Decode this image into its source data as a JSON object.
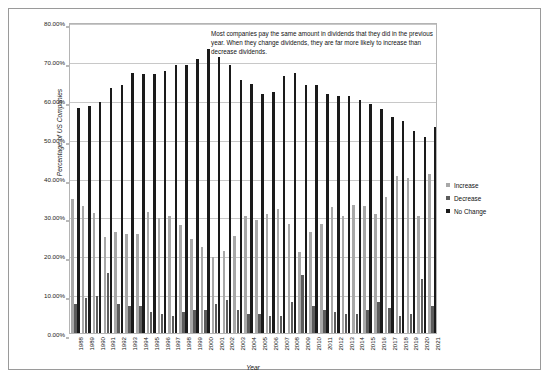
{
  "chart_data": {
    "type": "bar",
    "title": "",
    "xlabel": "Year",
    "ylabel": "Percentage of US Companies",
    "ylim": [
      0,
      80
    ],
    "ytick_labels": [
      "80.00%",
      "70.00%",
      "60.00%",
      "50.00%",
      "40.00%",
      "30.00%",
      "20.00%",
      "10.00%",
      "0.00%"
    ],
    "ytick_values": [
      80,
      70,
      60,
      50,
      40,
      30,
      20,
      10,
      0
    ],
    "grid": true,
    "legend_position": "right",
    "categories": [
      "1988",
      "1989",
      "1990",
      "1991",
      "1992",
      "1993",
      "1994",
      "1995",
      "1996",
      "1997",
      "1998",
      "1999",
      "2000",
      "2001",
      "2002",
      "2003",
      "2004",
      "2005",
      "2006",
      "2007",
      "2008",
      "2009",
      "2010",
      "2011",
      "2012",
      "2013",
      "2014",
      "2015",
      "2016",
      "2017",
      "2018",
      "2019",
      "2020",
      "2021"
    ],
    "series": [
      {
        "name": "Increase",
        "color": "#a8a8a8",
        "values": [
          34.5,
          32.8,
          31.0,
          24.8,
          26.0,
          25.5,
          25.5,
          31.2,
          29.5,
          30.2,
          27.8,
          24.3,
          22.2,
          19.5,
          21.0,
          25.0,
          30.2,
          29.0,
          30.5,
          32.0,
          28.0,
          20.8,
          26.0,
          28.0,
          32.5,
          30.0,
          33.0,
          32.8,
          30.5,
          35.0,
          40.5,
          40.0,
          30.0,
          41.0
        ]
      },
      {
        "name": "Decrease",
        "color": "#5c5c5c",
        "values": [
          7.5,
          9.0,
          9.5,
          15.5,
          7.5,
          7.0,
          7.0,
          5.5,
          5.0,
          4.5,
          5.5,
          6.0,
          5.8,
          7.5,
          8.5,
          6.0,
          5.0,
          4.8,
          4.5,
          4.5,
          8.0,
          15.0,
          7.0,
          6.0,
          5.5,
          5.0,
          5.0,
          6.0,
          8.0,
          6.5,
          4.5,
          5.0,
          14.0,
          7.0
        ]
      },
      {
        "name": "No Change",
        "color": "#1a1a1a",
        "values": [
          57.8,
          58.3,
          59.4,
          62.9,
          63.9,
          66.8,
          66.5,
          66.5,
          67.4,
          69.0,
          69.0,
          70.5,
          73.0,
          71.0,
          69.0,
          65.0,
          64.0,
          61.5,
          62.0,
          66.0,
          67.0,
          63.8,
          63.8,
          61.5,
          61.0,
          61.0,
          60.0,
          59.0,
          57.5,
          55.5,
          54.5,
          52.0,
          50.5,
          53.0
        ]
      }
    ],
    "annotation": "Most companies pay the same amount in dividends that they did in the previous year. When they change dividends, they are far more likely to increase than decrease dividends."
  },
  "legend": {
    "items": [
      {
        "label": "Increase",
        "color": "#a8a8a8"
      },
      {
        "label": "Decrease",
        "color": "#5c5c5c"
      },
      {
        "label": "No Change",
        "color": "#1a1a1a"
      }
    ]
  }
}
